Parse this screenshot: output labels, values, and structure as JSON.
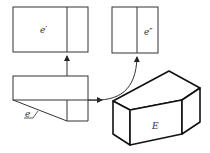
{
  "diagram": {
    "type": "orthographic projection of a solid",
    "labels": {
      "front_view": "e′",
      "side_view": "e″",
      "top_view": "e",
      "solid": "E"
    },
    "colors": {
      "line": "#222222",
      "background": "#ffffff"
    }
  }
}
